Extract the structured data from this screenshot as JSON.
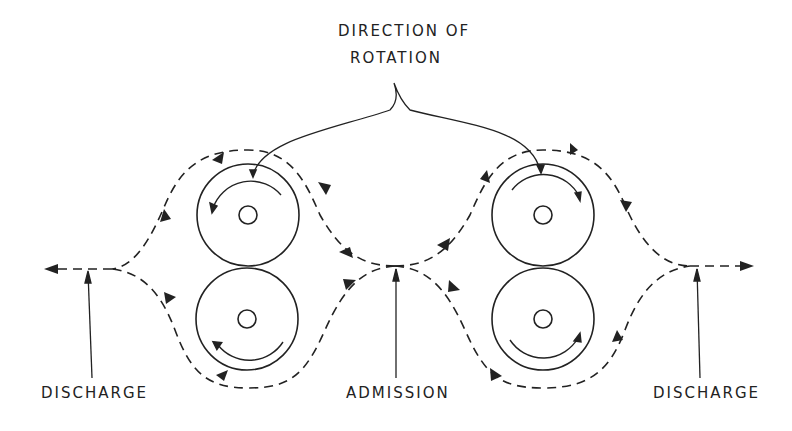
{
  "title": {
    "line1": "DIRECTION OF",
    "line2": "ROTATION"
  },
  "labels": {
    "discharge_left": "DISCHARGE",
    "admission": "ADMISSION",
    "discharge_right": "DISCHARGE"
  },
  "rotors": [
    {
      "id": "left-upper",
      "cx": 248,
      "cy": 215,
      "r": 51,
      "rotation": "counterclockwise"
    },
    {
      "id": "left-lower",
      "cx": 247,
      "cy": 319,
      "r": 51,
      "rotation": "clockwise"
    },
    {
      "id": "right-upper",
      "cx": 543,
      "cy": 215,
      "r": 51,
      "rotation": "clockwise"
    },
    {
      "id": "right-lower",
      "cx": 543,
      "cy": 319,
      "r": 51,
      "rotation": "counterclockwise"
    }
  ],
  "colors": {
    "ink": "#222222",
    "background": "#ffffff"
  }
}
